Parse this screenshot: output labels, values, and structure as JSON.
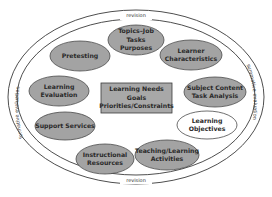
{
  "diagram": {
    "colors": {
      "ellipse_fill": "#a3a3a3",
      "ellipse_stroke": "#4a4a4a",
      "open_ellipse_fill": "#ffffff",
      "center_fill": "#a8a8a8",
      "ring_stroke": "#3a3a3a"
    },
    "ring": {
      "top_label": "revision",
      "bottom_label": "revision",
      "left_label": "formative evaluation",
      "right_label": "summative evaluation"
    },
    "center": {
      "text": "Learning Needs\nGoals\nPriorities/Constraints"
    },
    "nodes": [
      {
        "id": "topics",
        "text": "Topics–Job Tasks\nPurposes",
        "filled": true
      },
      {
        "id": "learner",
        "text": "Learner\nCharacteristics",
        "filled": true
      },
      {
        "id": "subject",
        "text": "Subject Content\nTask Analysis",
        "filled": true
      },
      {
        "id": "objectives",
        "text": "Learning\nObjectives",
        "filled": false
      },
      {
        "id": "teaching",
        "text": "Teaching/Learning\nActivities",
        "filled": true
      },
      {
        "id": "resources",
        "text": "Instructional\nResources",
        "filled": true
      },
      {
        "id": "support",
        "text": "Support Services",
        "filled": true
      },
      {
        "id": "evaluation",
        "text": "Learning\nEvaluation",
        "filled": true
      },
      {
        "id": "pretesting",
        "text": "Pretesting",
        "filled": true
      }
    ]
  }
}
